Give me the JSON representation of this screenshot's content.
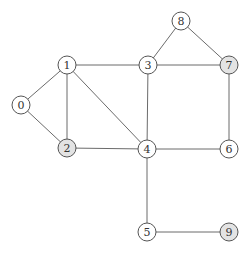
{
  "graph": {
    "title": "",
    "node_radius": 9,
    "colors": {
      "default_fill": "#ffffff",
      "highlight_fill": "#e3e3e3",
      "stroke": "#555555",
      "edge": "#6b6b6b",
      "label": "#333333"
    },
    "nodes": [
      {
        "id": "0",
        "label": "0",
        "x": 21,
        "y": 105,
        "highlighted": false
      },
      {
        "id": "1",
        "label": "1",
        "x": 67,
        "y": 65,
        "highlighted": false
      },
      {
        "id": "2",
        "label": "2",
        "x": 67,
        "y": 148,
        "highlighted": true
      },
      {
        "id": "3",
        "label": "3",
        "x": 148,
        "y": 65,
        "highlighted": false
      },
      {
        "id": "4",
        "label": "4",
        "x": 147,
        "y": 149,
        "highlighted": false
      },
      {
        "id": "5",
        "label": "5",
        "x": 147,
        "y": 232,
        "highlighted": false
      },
      {
        "id": "6",
        "label": "6",
        "x": 229,
        "y": 149,
        "highlighted": false
      },
      {
        "id": "7",
        "label": "7",
        "x": 229,
        "y": 65,
        "highlighted": true
      },
      {
        "id": "8",
        "label": "8",
        "x": 181,
        "y": 21,
        "highlighted": false
      },
      {
        "id": "9",
        "label": "9",
        "x": 229,
        "y": 232,
        "highlighted": true
      }
    ],
    "edges": [
      [
        "0",
        "1"
      ],
      [
        "0",
        "2"
      ],
      [
        "1",
        "2"
      ],
      [
        "1",
        "3"
      ],
      [
        "1",
        "4"
      ],
      [
        "2",
        "4"
      ],
      [
        "3",
        "4"
      ],
      [
        "3",
        "7"
      ],
      [
        "3",
        "8"
      ],
      [
        "8",
        "7"
      ],
      [
        "7",
        "6"
      ],
      [
        "4",
        "6"
      ],
      [
        "4",
        "5"
      ],
      [
        "5",
        "9"
      ]
    ]
  }
}
